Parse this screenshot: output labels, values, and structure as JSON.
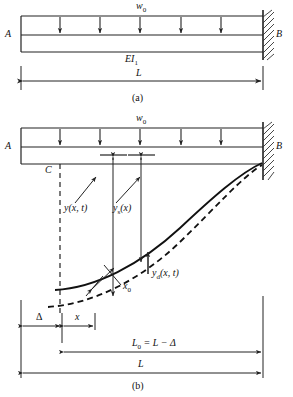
{
  "figure": {
    "title_caption_a": "(a)",
    "title_caption_b": "(b)",
    "panels": [
      {
        "id": "a",
        "caption": "(a)",
        "support_left_label": "A",
        "support_right_label": "B",
        "load_label": "w0",
        "load_label_base": "w",
        "load_label_sub": "0",
        "stiffness_label_base": "EI",
        "stiffness_label_sub": "1",
        "length_label": "L",
        "num_load_arrows": 5,
        "right_support": "fixed-hatched-wall",
        "left_support": "free-end"
      },
      {
        "id": "b",
        "caption": "(b)",
        "support_left_label": "A",
        "support_right_label": "B",
        "load_label_base": "w",
        "load_label_sub": "0",
        "point_label": "C",
        "num_load_arrows": 5,
        "curve_solid_name": "static-deflection-curve",
        "curve_dashed_name": "dynamic-deflection-curve",
        "annotations": [
          {
            "name": "total-deflection",
            "base": "y",
            "sub": "",
            "args": "(x, t)"
          },
          {
            "name": "static-deflection",
            "base": "y",
            "sub": "s",
            "args": "(x)"
          },
          {
            "name": "dynamic-deflection",
            "base": "y",
            "sub": "d",
            "args": "(x, t)"
          },
          {
            "name": "axial-shortening",
            "base": "x",
            "sub": "0",
            "args": ""
          }
        ],
        "dimensions": [
          {
            "name": "delta",
            "label": "Δ"
          },
          {
            "name": "x",
            "label": "x"
          },
          {
            "name": "L0",
            "label": "L0 = L - Δ"
          },
          {
            "name": "L",
            "label": "L"
          }
        ],
        "dim_l0_base": "L",
        "dim_l0_sub": "0",
        "dim_l0_rest": " = L − Δ",
        "dim_delta": "Δ",
        "dim_x": "x",
        "dim_L": "L"
      }
    ],
    "colors": {
      "line": "#222222",
      "curve": "#111111",
      "background": "#ffffff",
      "hatch": "#333333"
    }
  }
}
